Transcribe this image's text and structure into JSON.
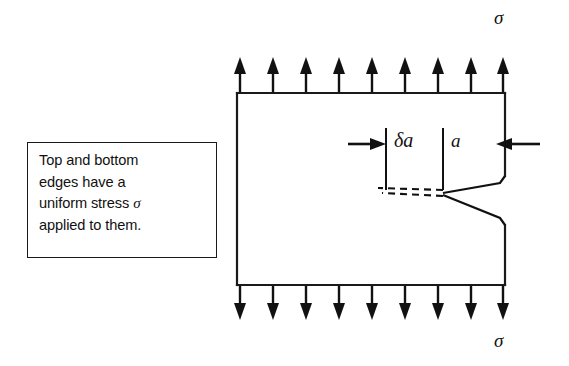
{
  "figure": {
    "type": "engineering-diagram",
    "background_color": "#ffffff",
    "line_color": "#1a1a1a"
  },
  "note": {
    "line1": "Top and bottom",
    "line2": "edges have a",
    "line3_prefix": "uniform stress ",
    "line3_symbol": "σ",
    "line4": "applied to them."
  },
  "labels": {
    "sigma_top": "σ",
    "sigma_bottom": "σ",
    "delta_a": "δa",
    "a": "a"
  },
  "plate": {
    "left": 237,
    "top": 93,
    "right": 505,
    "bottom": 285
  },
  "arrows": {
    "top": {
      "count": 9,
      "direction": "up",
      "x_positions": [
        240,
        273,
        306,
        339,
        372,
        405,
        438,
        471,
        503
      ],
      "tail_y": 92,
      "head_y": 58
    },
    "bottom": {
      "count": 9,
      "direction": "down",
      "x_positions": [
        240,
        273,
        306,
        339,
        372,
        405,
        438,
        471,
        503
      ],
      "tail_y": 286,
      "head_y": 320
    },
    "dimension_left": {
      "direction": "right",
      "x_start": 348,
      "x_end": 386,
      "y": 144
    },
    "dimension_right": {
      "direction": "left",
      "x_start": 540,
      "x_end": 498,
      "y": 144
    }
  },
  "dimension_ticks": {
    "tick_1_x": 386,
    "tick_2_x": 443,
    "top_y": 128,
    "bottom_y": 190
  },
  "crack": {
    "solid_upper": [
      [
        505,
        176
      ],
      [
        500,
        183
      ],
      [
        443,
        193
      ]
    ],
    "solid_lower": [
      [
        443,
        195
      ],
      [
        500,
        218
      ],
      [
        505,
        225
      ]
    ],
    "dashed_upper": [
      [
        443,
        190
      ],
      [
        378,
        188
      ]
    ],
    "dashed_lower": [
      [
        443,
        196
      ],
      [
        382,
        192
      ]
    ],
    "tip_x": 443,
    "tip_y": 193
  }
}
